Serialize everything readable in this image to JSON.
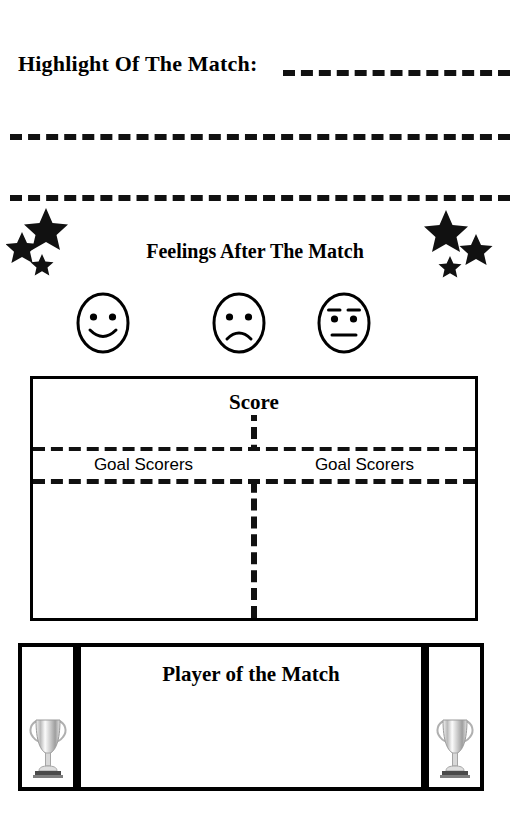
{
  "page": {
    "kind": "match-report-worksheet",
    "background_color": "#ffffff",
    "ink_color": "#000000"
  },
  "highlight_section": {
    "title": "Highlight Of The Match:",
    "writing_lines": 3
  },
  "feelings_section": {
    "title": "Feelings After The Match",
    "star_clusters": [
      {
        "side": "left",
        "icon": "stars-decoration-icon",
        "count": 3
      },
      {
        "side": "right",
        "icon": "stars-decoration-icon",
        "count": 3
      }
    ],
    "faces": [
      {
        "icon": "happy-face-icon",
        "label": "happy"
      },
      {
        "icon": "sad-face-icon",
        "label": "sad"
      },
      {
        "icon": "neutral-face-icon",
        "label": "neutral"
      }
    ]
  },
  "score_section": {
    "title": "Score",
    "columns": [
      {
        "heading": "Goal Scorers"
      },
      {
        "heading": "Goal Scorers"
      }
    ]
  },
  "player_of_the_match_section": {
    "title": "Player of the Match",
    "trophies": [
      {
        "side": "left",
        "icon": "trophy-icon"
      },
      {
        "side": "right",
        "icon": "trophy-icon"
      }
    ]
  }
}
